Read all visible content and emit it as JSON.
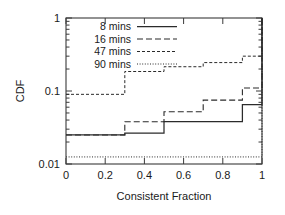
{
  "chart_data": {
    "type": "line",
    "title": "",
    "xlabel": "Consistent Fraction",
    "ylabel": "CDF",
    "yscale": "log",
    "xlim": [
      0,
      1
    ],
    "ylim": [
      0.01,
      1
    ],
    "grid": false,
    "legend_position": "top-left",
    "xticks": [
      "0",
      "0.2",
      "0.4",
      "0.6",
      "0.8",
      "1"
    ],
    "xtick_values": [
      0,
      0.2,
      0.4,
      0.6,
      0.8,
      1
    ],
    "yticks": [
      "1",
      "0.1",
      "0.01"
    ],
    "ytick_values": [
      1,
      0.1,
      0.01
    ],
    "series": [
      {
        "name": "8 mins",
        "style": "solid",
        "x": [
          0,
          0.3,
          0.3,
          0.5,
          0.5,
          0.9,
          0.9,
          1.0,
          1.0
        ],
        "y": [
          0.025,
          0.025,
          0.0265,
          0.0265,
          0.038,
          0.038,
          0.065,
          0.065,
          1.0
        ]
      },
      {
        "name": "16 mins",
        "style": "dashed",
        "x": [
          0,
          0.3,
          0.3,
          0.5,
          0.5,
          0.7,
          0.7,
          0.9,
          0.9,
          1.0,
          1.0
        ],
        "y": [
          0.025,
          0.025,
          0.038,
          0.038,
          0.052,
          0.052,
          0.075,
          0.075,
          0.11,
          0.11,
          1.0
        ]
      },
      {
        "name": "47 mins",
        "style": "short-dash",
        "x": [
          0,
          0.3,
          0.3,
          0.5,
          0.5,
          0.7,
          0.7,
          0.9,
          0.9,
          1.0,
          1.0
        ],
        "y": [
          0.09,
          0.09,
          0.185,
          0.185,
          0.215,
          0.215,
          0.245,
          0.245,
          0.3,
          0.3,
          1.0
        ]
      },
      {
        "name": "90 mins",
        "style": "dotted",
        "x": [
          0,
          1.0,
          1.0
        ],
        "y": [
          0.0125,
          0.0125,
          1.0
        ]
      }
    ]
  },
  "legend": {
    "entries": [
      {
        "label": "8 mins"
      },
      {
        "label": "16 mins"
      },
      {
        "label": "47 mins"
      },
      {
        "label": "90 mins"
      }
    ]
  }
}
